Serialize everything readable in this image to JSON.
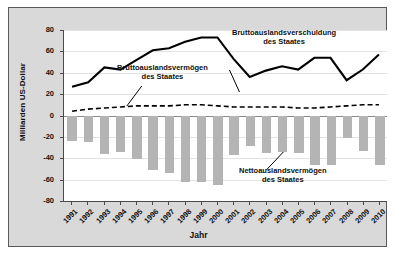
{
  "chart_data": {
    "type": "bar",
    "title": "",
    "xlabel": "Jahr",
    "ylabel": "Milliarden US-Dollar",
    "ylim": [
      -80,
      80
    ],
    "yticks": [
      80,
      60,
      40,
      20,
      0,
      -20,
      -40,
      -60,
      -80
    ],
    "grid": true,
    "legend_position": "inline-annotations",
    "categories": [
      "1991",
      "1992",
      "1993",
      "1994",
      "1995",
      "1996",
      "1997",
      "1998",
      "1999",
      "2000",
      "2001",
      "2002",
      "2003",
      "2004",
      "2005",
      "2006",
      "2007",
      "2008",
      "2009",
      "2010"
    ],
    "series": [
      {
        "name": "Bruttoauslandsverschuldung des Staates",
        "type": "line",
        "style": "solid",
        "color": "#000000",
        "values": [
          27,
          31,
          45,
          43,
          52,
          61,
          63,
          69,
          73,
          73,
          53,
          36,
          42,
          46,
          43,
          54,
          54,
          33,
          43,
          57
        ]
      },
      {
        "name": "Bruttoauslandsvermögen des Staates",
        "type": "line",
        "style": "dashed",
        "color": "#000000",
        "values": [
          4,
          6,
          7,
          8,
          9,
          9,
          9,
          10,
          10,
          9,
          8,
          8,
          8,
          8,
          7,
          7,
          8,
          9,
          10,
          10
        ]
      },
      {
        "name": "Nettoauslandsvermögen des Staates",
        "type": "bar",
        "color": "#b4b4b4",
        "values": [
          -24,
          -25,
          -36,
          -34,
          -41,
          -51,
          -54,
          -62,
          -62,
          -65,
          -37,
          -29,
          -35,
          -34,
          -35,
          -46,
          -46,
          -21,
          -33,
          -46
        ]
      }
    ],
    "annotations": [
      {
        "id": "gross-debt",
        "line1": "Bruttoauslandsverschuldung",
        "line2": "des Staates"
      },
      {
        "id": "gross-asset",
        "line1": "Bruttoauslandsvermögen",
        "line2": "des Staates"
      },
      {
        "id": "net-asset",
        "line1": "Nettoauslandsvermögen",
        "line2": "des Staates"
      }
    ]
  }
}
